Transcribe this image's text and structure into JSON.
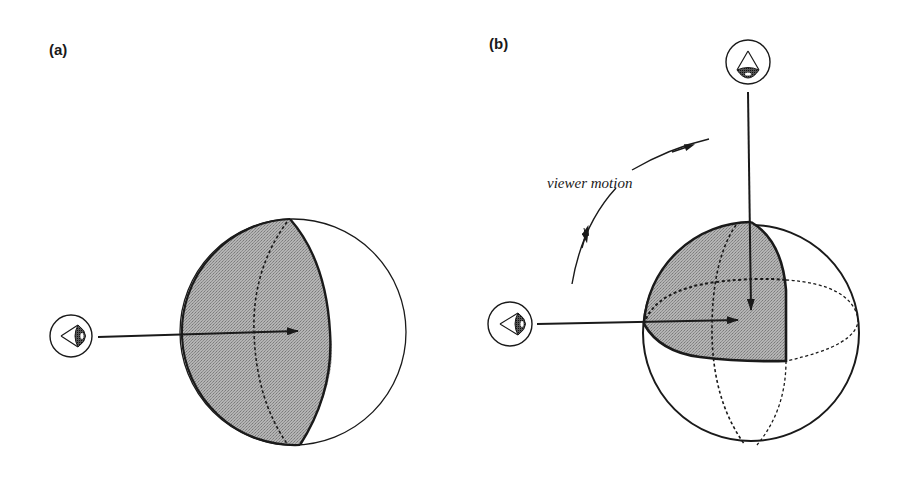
{
  "figure": {
    "panels": [
      {
        "id": "a",
        "label": "(a)",
        "description": "Viewer looking at a sphere from the side; the visible hemisphere-like region facing the viewer is shaded",
        "viewers": [
          {
            "position": "left",
            "icon": "eye-icon",
            "direction": "right"
          }
        ]
      },
      {
        "id": "b",
        "label": "(b)",
        "description": "Viewer moves from the side to the top of the sphere; the shaded region is the intersection of the two visible hemispheres",
        "viewers": [
          {
            "position": "left",
            "icon": "eye-icon",
            "direction": "right"
          },
          {
            "position": "top",
            "icon": "eye-icon",
            "direction": "down"
          }
        ],
        "annotation": "viewer motion"
      }
    ]
  },
  "colors": {
    "ink": "#1a1a1a",
    "shade": "#a8a8a8",
    "background": "#ffffff"
  }
}
